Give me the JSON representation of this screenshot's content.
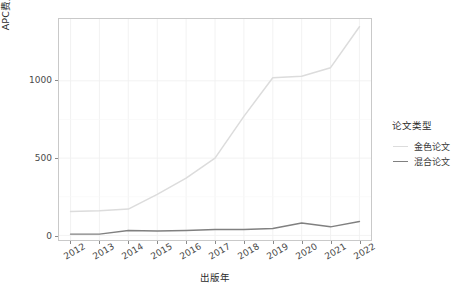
{
  "chart_data": {
    "type": "line",
    "title": "",
    "xlabel": "出版年",
    "ylabel": "APC费用（万元）",
    "x": [
      2012,
      2013,
      2014,
      2015,
      2016,
      2017,
      2018,
      2019,
      2020,
      2021,
      2022
    ],
    "xtick_labels": [
      "2012",
      "2013",
      "2014",
      "2015",
      "2016",
      "2017",
      "2018",
      "2019",
      "2020",
      "2021",
      "2022"
    ],
    "ytick_labels": [
      "0",
      "500",
      "1000"
    ],
    "yticks": [
      0,
      500,
      1000
    ],
    "ylim": [
      -30,
      1400
    ],
    "xlim": [
      2011.6,
      2022.4
    ],
    "grid": true,
    "legend_position": "right",
    "legend": {
      "title": "论文类型",
      "entries": [
        {
          "name": "金色论文",
          "color": "#dcdcdc"
        },
        {
          "name": "混合论文",
          "color": "#808080"
        }
      ]
    },
    "series": [
      {
        "name": "金色论文",
        "color": "#dcdcdc",
        "values": [
          155,
          160,
          170,
          265,
          370,
          500,
          770,
          1020,
          1030,
          1085,
          1350
        ]
      },
      {
        "name": "混合论文",
        "color": "#808080",
        "values": [
          8,
          8,
          32,
          28,
          32,
          38,
          38,
          45,
          80,
          55,
          90
        ]
      }
    ],
    "background": "#ffffff",
    "panel_border": "#c9c9c9",
    "gridline_color": "#f0f0f0"
  }
}
